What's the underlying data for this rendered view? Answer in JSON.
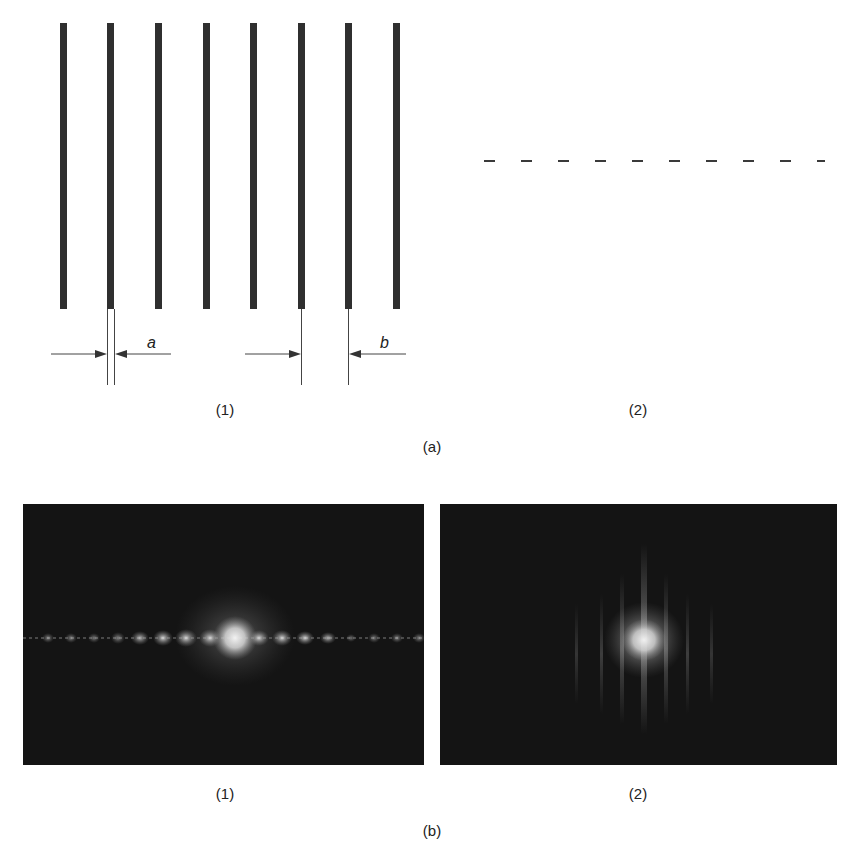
{
  "figure": {
    "part_a": {
      "label": "(a)",
      "sub1": {
        "label": "(1)",
        "description": "Grating of vertical slits",
        "slit_count": 8,
        "dimension_labels": {
          "slit_width": "a",
          "slit_spacing": "b"
        }
      },
      "sub2": {
        "label": "(2)",
        "description": "Row of short horizontal dashes",
        "dash_count": 10
      }
    },
    "part_b": {
      "label": "(b)",
      "sub1": {
        "label": "(1)",
        "description": "Diffraction pattern of slit grating: horizontal row of bright spots"
      },
      "sub2": {
        "label": "(2)",
        "description": "Diffraction pattern of dash row: central bright spot with vertical streaks"
      }
    }
  },
  "colors": {
    "background": "#ffffff",
    "ink": "#2f2f2f",
    "panel_background": "#141414",
    "bright_spot": "#e8e8e8"
  }
}
